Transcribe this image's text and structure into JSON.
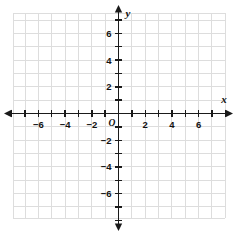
{
  "figure": {
    "kind": "cartesian-coordinate-plane",
    "background_color": "#ffffff",
    "grid_color": "#dddddd",
    "axis_color": "#1a1a1a",
    "text_color": "#111111"
  },
  "axes": {
    "x_axis_label": "x",
    "y_axis_label": "y",
    "origin_label": "O"
  },
  "chart_data": {
    "type": "scatter",
    "title": "",
    "xlabel": "x",
    "ylabel": "y",
    "series": [
      {
        "name": "data",
        "x": [],
        "y": []
      }
    ],
    "xlim": [
      -8,
      8
    ],
    "ylim": [
      -8,
      8
    ],
    "xticks": [
      -8,
      -7,
      -6,
      -5,
      -4,
      -3,
      -2,
      -1,
      1,
      2,
      3,
      4,
      5,
      6,
      7,
      8
    ],
    "yticks": [
      -8,
      -7,
      -6,
      -5,
      -4,
      -3,
      -2,
      -1,
      1,
      2,
      3,
      4,
      5,
      6,
      7,
      8
    ],
    "xtick_labels_shown": [
      "−6",
      "−4",
      "−2",
      "2",
      "4",
      "6"
    ],
    "ytick_labels_shown": [
      "6",
      "4",
      "2",
      "−2",
      "−4",
      "−6"
    ],
    "xtick_label_values": [
      -6,
      -4,
      -2,
      2,
      4,
      6
    ],
    "ytick_label_values": [
      6,
      4,
      2,
      -2,
      -4,
      -6
    ],
    "grid": true,
    "grid_step": 1,
    "legend": null,
    "annotations": []
  },
  "x_tick_labels": [
    {
      "value": -6,
      "text": "−6"
    },
    {
      "value": -4,
      "text": "−4"
    },
    {
      "value": -2,
      "text": "−2"
    },
    {
      "value": 2,
      "text": "2"
    },
    {
      "value": 4,
      "text": "4"
    },
    {
      "value": 6,
      "text": "6"
    }
  ],
  "y_tick_labels": [
    {
      "value": 6,
      "text": "6"
    },
    {
      "value": 4,
      "text": "4"
    },
    {
      "value": 2,
      "text": "2"
    },
    {
      "value": -2,
      "text": "−2"
    },
    {
      "value": -4,
      "text": "−4"
    },
    {
      "value": -6,
      "text": "−6"
    }
  ]
}
